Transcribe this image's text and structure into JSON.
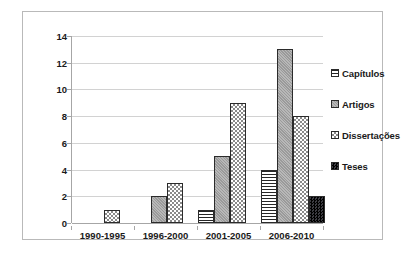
{
  "chart_data": {
    "type": "bar",
    "title": "",
    "subtitle": "",
    "xlabel": "",
    "ylabel": "",
    "categories": [
      "1990-1995",
      "1996-2000",
      "2001-2005",
      "2006-2010"
    ],
    "series": [
      {
        "name": "Capítulos",
        "values": [
          0,
          0,
          1,
          4
        ],
        "pattern": "horizontal-lines",
        "color": "#ffffff"
      },
      {
        "name": "Artigos",
        "values": [
          0,
          2,
          5,
          13
        ],
        "pattern": "solid-gray",
        "color": "#9a9a9a"
      },
      {
        "name": "Dissertações",
        "values": [
          1,
          3,
          9,
          8
        ],
        "pattern": "checkered-dots",
        "color": "#f2f2f2"
      },
      {
        "name": "Teses",
        "values": [
          0,
          0,
          0,
          2
        ],
        "pattern": "dark-speckle",
        "color": "#17171a"
      }
    ],
    "ylim": [
      0,
      14
    ],
    "ytick_values": [
      0,
      2,
      4,
      6,
      8,
      10,
      12,
      14
    ],
    "ytick_labels": [
      "0",
      "2",
      "4",
      "6",
      "8",
      "10",
      "12",
      "14"
    ],
    "grid": true,
    "grid_axis": "y",
    "legend_position": "right",
    "legend_entries": [
      "Capítulos",
      "Artigos",
      "Dissertações",
      "Teses"
    ],
    "frame_color": "#b9b9b9",
    "gridline_color": "#d2d2d2",
    "axis_color": "#a6a6a6",
    "text_color": "#1a1a1a",
    "background": "#ffffff"
  }
}
